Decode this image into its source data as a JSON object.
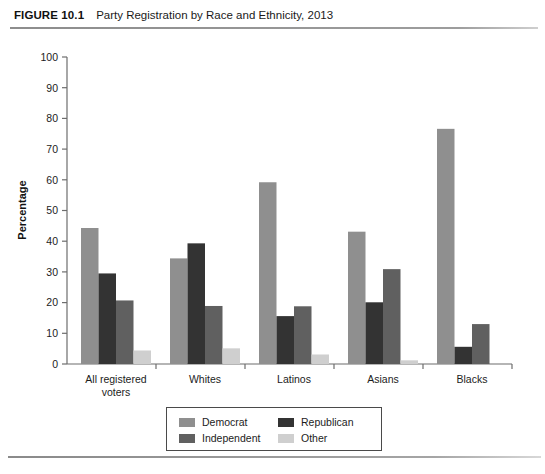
{
  "figure": {
    "number": "FIGURE 10.1",
    "title": "Party Registration by Race and Ethnicity, 2013"
  },
  "chart_data": {
    "type": "bar",
    "title": "Party Registration by Race and Ethnicity, 2013",
    "xlabel": "",
    "ylabel": "Percentage",
    "ylim": [
      0,
      100
    ],
    "yticks": [
      0,
      10,
      20,
      30,
      40,
      50,
      60,
      70,
      80,
      90,
      100
    ],
    "ytick_labels": [
      "0",
      "10",
      "20",
      "30",
      "40",
      "50",
      "60",
      "70",
      "80",
      "90",
      "100"
    ],
    "grid": false,
    "legend_position": "bottom-center",
    "categories": [
      "All registered voters",
      "Whites",
      "Latinos",
      "Asians",
      "Blacks"
    ],
    "category_lines": [
      [
        "All registered",
        "voters"
      ],
      [
        "Whites"
      ],
      [
        "Latinos"
      ],
      [
        "Asians"
      ],
      [
        "Blacks"
      ]
    ],
    "series": [
      {
        "name": "Democrat",
        "color": "#8f8f8f",
        "values": [
          44.3,
          34.4,
          59.2,
          43.1,
          76.6
        ]
      },
      {
        "name": "Republican",
        "color": "#333333",
        "values": [
          29.5,
          39.3,
          15.6,
          20.1,
          5.6
        ]
      },
      {
        "name": "Independent",
        "color": "#606060",
        "values": [
          20.7,
          18.9,
          18.8,
          30.9,
          13.0
        ]
      },
      {
        "name": "Other",
        "color": "#cfcfcf",
        "values": [
          4.4,
          5.1,
          3.1,
          1.2,
          0.0
        ]
      }
    ]
  },
  "legend": {
    "items": [
      {
        "label": "Democrat",
        "color": "#8f8f8f"
      },
      {
        "label": "Republican",
        "color": "#333333"
      },
      {
        "label": "Independent",
        "color": "#606060"
      },
      {
        "label": "Other",
        "color": "#cfcfcf"
      }
    ]
  },
  "axis": {
    "y_title": "Percentage"
  }
}
